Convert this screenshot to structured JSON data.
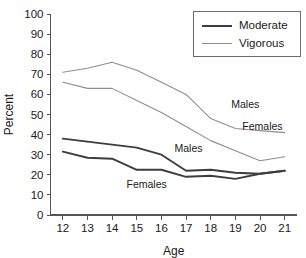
{
  "chart_data": {
    "type": "line",
    "title": "",
    "xlabel": "Age",
    "ylabel": "Percent",
    "x": [
      12,
      13,
      14,
      15,
      16,
      17,
      18,
      19,
      20,
      21
    ],
    "xlim": [
      11.5,
      21.5
    ],
    "ylim": [
      0,
      100
    ],
    "xticks": [
      "12",
      "13",
      "14",
      "15",
      "16",
      "17",
      "18",
      "19",
      "20",
      "21"
    ],
    "yticks": [
      "0",
      "10",
      "20",
      "30",
      "40",
      "50",
      "60",
      "70",
      "80",
      "90",
      "100"
    ],
    "grid": false,
    "legend_position": "top-right",
    "series": [
      {
        "name": "Vigorous Males",
        "intensity": "Vigorous",
        "sex": "Males",
        "color": "#8e8e8e",
        "values": [
          71,
          73,
          76,
          72,
          66,
          60,
          48,
          43,
          42,
          41
        ]
      },
      {
        "name": "Vigorous Females",
        "intensity": "Vigorous",
        "sex": "Females",
        "color": "#8e8e8e",
        "values": [
          66,
          63,
          63,
          57,
          51,
          44,
          37,
          32,
          27,
          29
        ]
      },
      {
        "name": "Moderate Males",
        "intensity": "Moderate",
        "sex": "Males",
        "color": "#3d3d3d",
        "values": [
          38,
          36.5,
          35,
          33.5,
          30,
          22,
          22.5,
          21,
          20.5,
          22
        ]
      },
      {
        "name": "Moderate Females",
        "intensity": "Moderate",
        "sex": "Females",
        "color": "#3d3d3d",
        "values": [
          31.5,
          28.5,
          28,
          22.5,
          22.5,
          19,
          19.5,
          18,
          20.5,
          22
        ]
      }
    ],
    "annotations": [
      {
        "text": "Males",
        "x": 19.4,
        "y": 53,
        "series": "Vigorous Males"
      },
      {
        "text": "Females",
        "x": 20.1,
        "y": 42.5,
        "series": "Vigorous Females"
      },
      {
        "text": "Males",
        "x": 17.1,
        "y": 31.5,
        "series": "Moderate Males"
      },
      {
        "text": "Females",
        "x": 15.4,
        "y": 13.5,
        "series": "Moderate Females"
      }
    ],
    "legend": [
      {
        "label": "Moderate",
        "color": "#3d3d3d",
        "width": 2
      },
      {
        "label": "Vigorous",
        "color": "#8e8e8e",
        "width": 1.2
      }
    ]
  }
}
